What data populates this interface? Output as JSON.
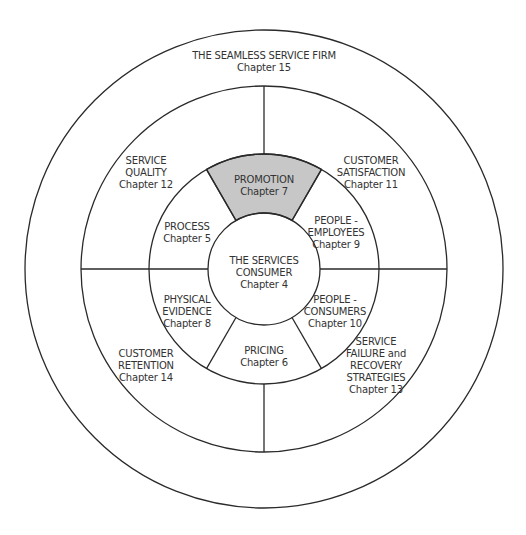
{
  "diagram": {
    "colors": {
      "line": "#2a2a2a",
      "text": "#333333",
      "highlight_fill": "#c7c7c7",
      "background": "#ffffff"
    },
    "outer_ring": {
      "title": "THE SEAMLESS SERVICE FIRM",
      "chapter": "Chapter 15"
    },
    "middle_ring": [
      {
        "lines": [
          "SERVICE",
          "QUALITY"
        ],
        "chapter": "Chapter 12"
      },
      {
        "lines": [
          "CUSTOMER",
          "SATISFACTION"
        ],
        "chapter": "Chapter 11"
      },
      {
        "lines": [
          "SERVICE",
          "FAILURE and",
          "RECOVERY",
          "STRATEGIES"
        ],
        "chapter": "Chapter 13"
      },
      {
        "lines": [
          "CUSTOMER",
          "RETENTION"
        ],
        "chapter": "Chapter 14"
      }
    ],
    "inner_ring": [
      {
        "lines": [
          "PROMOTION"
        ],
        "chapter": "Chapter 7",
        "highlighted": true
      },
      {
        "lines": [
          "PEOPLE -",
          "EMPLOYEES"
        ],
        "chapter": "Chapter 9"
      },
      {
        "lines": [
          "PEOPLE -",
          "CONSUMERS"
        ],
        "chapter": "Chapter 10"
      },
      {
        "lines": [
          "PRICING"
        ],
        "chapter": "Chapter 6"
      },
      {
        "lines": [
          "PHYSICAL",
          "EVIDENCE"
        ],
        "chapter": "Chapter 8"
      },
      {
        "lines": [
          "PROCESS"
        ],
        "chapter": "Chapter 5"
      }
    ],
    "core": {
      "lines": [
        "THE SERVICES",
        "CONSUMER"
      ],
      "chapter": "Chapter 4"
    }
  }
}
